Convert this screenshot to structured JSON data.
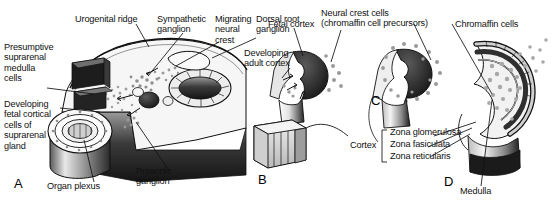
{
  "figure": {
    "background_color": "#ffffff",
    "ink_color": "#111111",
    "panel_count": 4
  },
  "panels": [
    {
      "letter": "A",
      "caption": "Embryonic cross-section showing neural crest migration to the presumptive suprarenal gland"
    },
    {
      "letter": "B",
      "caption": "Developing adult cortex and fetal cortex with neural crest cells"
    },
    {
      "letter": "C",
      "caption": "Chromaffin cells surrounding the fetal cortex"
    },
    {
      "letter": "D",
      "caption": "Mature suprarenal gland with cortical zones and medulla"
    }
  ],
  "labels": {
    "urogenital_ridge": "Urogenital ridge",
    "sympathetic_ganglion": "Sympathetic\nganglion",
    "migrating_neural_crest": "Migrating\nneural\ncrest",
    "dorsal_root_ganglion": "Dorsal root\nganglion",
    "presumptive_medulla": "Presumptive\nsuprarenal\nmedulla\ncells",
    "developing_fetal_cortical": "Developing\nfetal cortical\ncells of\nsuprarenal\ngland",
    "organ_plexus": "Organ plexus",
    "preaortic_ganglion": "Preaortic\nganglion",
    "fetal_cortex": "Fetal cortex",
    "neural_crest_cells": "Neural crest cells\n(chromaffin cell precursors)",
    "developing_adult_cortex": "Developing\nadult cortex",
    "chromaffin_cells": "Chromaffin cells",
    "cortex": "Cortex",
    "zona_glomerulosa": "Zona glomerulosa",
    "zona_fasiculata": "Zona fasiculata",
    "zona_reticularis": "Zona reticularis",
    "medulla": "Medulla"
  },
  "panel_letters": {
    "a": "A",
    "b": "B",
    "c": "C",
    "d": "D"
  },
  "colors": {
    "ink": "#111111",
    "dark_fill": "#2b2b2b",
    "mid_gray": "#8c8c8c",
    "light_gray": "#d8d8d8",
    "pale": "#f2f2f2",
    "stipple": "#9a9a9a"
  }
}
